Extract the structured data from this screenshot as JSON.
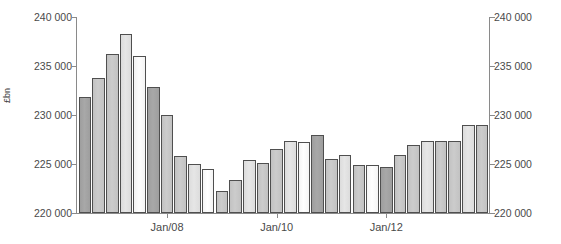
{
  "chart_data": {
    "type": "bar",
    "title": "",
    "subtitle": "",
    "xlabel": "",
    "ylabel": "£bn",
    "ylim": [
      220000,
      240000
    ],
    "ytick_values": [
      220000,
      225000,
      230000,
      235000,
      240000
    ],
    "ytick_labels": [
      "220 000",
      "225 000",
      "230 000",
      "235 000",
      "240 000"
    ],
    "ytick_labels_right": [
      "220 000",
      "225 000",
      "230 000",
      "235 000",
      "240 000"
    ],
    "grid": false,
    "legend": "none",
    "dual_axis": true,
    "xtick_labels": [
      "Jan/08",
      "Jan/10",
      "Jan/12"
    ],
    "xtick_indices": [
      6,
      14,
      22
    ],
    "categories": [
      "2006 Q3",
      "2006 Q4",
      "2007 Q1",
      "2007 Q2",
      "2007 Q3",
      "2007 Q4",
      "Jan/08",
      "2008 Q2",
      "2008 Q3",
      "2008 Q4",
      "2009 Q1",
      "2009 Q2",
      "2009 Q3",
      "2009 Q4",
      "Jan/10",
      "2010 Q2",
      "2010 Q3",
      "2010 Q4",
      "2011 Q1",
      "2011 Q2",
      "2011 Q3",
      "2011 Q4",
      "Jan/12",
      "2012 Q2",
      "2012 Q3",
      "2012 Q4",
      "2013 Q1",
      "2013 Q2",
      "2013 Q3",
      "2013 Q4"
    ],
    "values": [
      231800,
      233800,
      236200,
      238300,
      236000,
      232900,
      230000,
      225800,
      225000,
      224500,
      222200,
      223400,
      225400,
      225100,
      226500,
      227300,
      227200,
      228000,
      225500,
      225900,
      224900,
      224900,
      224700,
      225900,
      226900,
      227300,
      227300,
      227300,
      229000,
      229000
    ],
    "bar_shades": [
      "dark",
      "medium",
      "medium",
      "light",
      "white",
      "dark",
      "medium",
      "medium",
      "light",
      "white",
      "medium",
      "medium",
      "light",
      "medium",
      "medium",
      "light",
      "white",
      "dark",
      "medium",
      "light",
      "medium",
      "white",
      "dark",
      "medium",
      "medium",
      "light",
      "medium",
      "medium",
      "light",
      "medium"
    ],
    "colors": {
      "dark": "#9e9e9e",
      "medium": "#c2c2c2",
      "light": "#dcdcdc",
      "white": "#f4f4f4",
      "bar_border": "#4f4f4f",
      "axis": "#8a8a8a",
      "text": "#4a4a4a",
      "background": "#ffffff"
    }
  }
}
